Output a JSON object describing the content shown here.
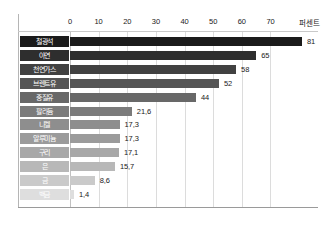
{
  "chart_data": {
    "type": "bar",
    "orientation": "horizontal",
    "title": "",
    "xlabel": "퍼센트",
    "ylabel": "",
    "xlim": [
      0,
      81
    ],
    "axis_unit": "퍼센트",
    "ticks": [
      0,
      10,
      20,
      30,
      40,
      50,
      60,
      70
    ],
    "tick_labels": [
      "0",
      "10",
      "20",
      "30",
      "40",
      "50",
      "60",
      "70"
    ],
    "grid": true,
    "legend": "none",
    "categories": [
      "철광석",
      "아연",
      "천연가스",
      "브렌트유",
      "중질유",
      "팔라듐",
      "니켈",
      "알루미늄",
      "구리",
      "은",
      "금",
      "백금"
    ],
    "values": [
      81,
      65,
      58,
      52,
      44,
      21.6,
      17.3,
      17.3,
      17.1,
      15.7,
      8.6,
      1.4
    ],
    "value_labels": [
      "81",
      "65",
      "58",
      "52",
      "44",
      "21,6",
      "17,3",
      "17,3",
      "17,1",
      "15,7",
      "8,6",
      "1,4"
    ],
    "bar_colors": [
      "#1b1b1b",
      "#2e2e2e",
      "#414141",
      "#555555",
      "#686868",
      "#7b7b7b",
      "#8e8e8e",
      "#9b9b9b",
      "#a8a8a8",
      "#b8b8b8",
      "#cacaca",
      "#dedede"
    ],
    "label_box_colors": [
      "#1b1b1b",
      "#2e2e2e",
      "#414141",
      "#555555",
      "#686868",
      "#7b7b7b",
      "#8e8e8e",
      "#9b9b9b",
      "#a8a8a8",
      "#b8b8b8",
      "#cacaca",
      "#dedede"
    ]
  }
}
